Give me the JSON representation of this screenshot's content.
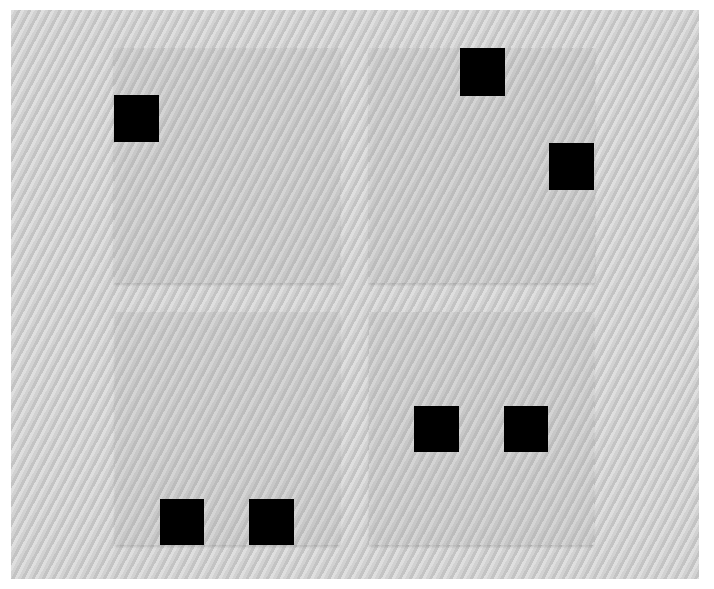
{
  "colors": {
    "background": "#ffffff",
    "frame": "#d2d2d2",
    "panel": "#c8c8c8",
    "square": "#000000"
  },
  "panels": [
    {
      "id": "top-left",
      "squares": [
        {
          "position": "left edge, upper"
        }
      ]
    },
    {
      "id": "top-right",
      "squares": [
        {
          "position": "top edge, center"
        },
        {
          "position": "right edge, upper-middle"
        }
      ]
    },
    {
      "id": "bottom-left",
      "squares": [
        {
          "position": "bottom edge, left-center"
        },
        {
          "position": "bottom edge, right-center"
        }
      ]
    },
    {
      "id": "bottom-right",
      "squares": [
        {
          "position": "middle, left-center"
        },
        {
          "position": "middle, right-center"
        }
      ]
    }
  ]
}
